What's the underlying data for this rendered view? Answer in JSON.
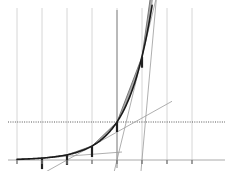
{
  "figure": {
    "title": "",
    "background_color": "#ffffff",
    "width": 229,
    "height": 171
  },
  "chart_data": {
    "type": "line",
    "title": "",
    "subtitle": "",
    "xlabel": "",
    "ylabel": "",
    "grid": true,
    "legend": null,
    "legend_position": "none",
    "xlim": [
      -4,
      4
    ],
    "ylim": [
      -0.6,
      7.0
    ],
    "x_ticks": [
      -4,
      -3,
      -2,
      -1,
      0,
      1,
      2,
      3
    ],
    "x_tick_labels": [
      "",
      "",
      "",
      "",
      "",
      "",
      "",
      ""
    ],
    "y_ticks": [
      1
    ],
    "y_tick_labels": [
      ""
    ],
    "axes": {
      "x_axis_y_value": 0,
      "y_axis_x_value": 0,
      "x_axis_color": "#aaaaaa",
      "y_axis_color": "#888888"
    },
    "reference_lines": [
      {
        "name": "unit-ordinate-line",
        "orientation": "horizontal",
        "value": 1,
        "style": "dotted",
        "color": "#444444"
      }
    ],
    "series": [
      {
        "name": "exponential-curve",
        "type": "line",
        "color": "#1a1a1a",
        "width": 1.6,
        "x": [
          -4.0,
          -3.6,
          -3.2,
          -2.8,
          -2.4,
          -2.0,
          -1.6,
          -1.2,
          -0.8,
          -0.4,
          0.0,
          0.4,
          0.8,
          1.2,
          1.6,
          2.0,
          2.4,
          2.8,
          3.0,
          3.2
        ],
        "y": [
          0.018,
          0.027,
          0.041,
          0.061,
          0.091,
          0.135,
          0.202,
          0.301,
          0.449,
          0.67,
          1.0,
          1.492,
          2.226,
          3.32,
          4.953,
          7.389,
          11.02,
          16.44,
          20.09,
          24.53
        ]
      },
      {
        "name": "secant-chords",
        "type": "segments",
        "color": "#6f6f6f",
        "width": 0.9,
        "chords": [
          {
            "x0": -4,
            "y0": 0.018,
            "x1": -3,
            "y1": 0.05
          },
          {
            "x0": -3,
            "y0": 0.05,
            "x1": -2,
            "y1": 0.135
          },
          {
            "x0": -2,
            "y0": 0.135,
            "x1": -1,
            "y1": 0.368
          },
          {
            "x0": -1,
            "y0": 0.368,
            "x1": 0,
            "y1": 1.0
          },
          {
            "x0": 0,
            "y0": 1.0,
            "x1": 1,
            "y1": 2.718
          },
          {
            "x0": 1,
            "y0": 2.718,
            "x1": 2,
            "y1": 7.389
          },
          {
            "x0": 2,
            "y0": 7.389,
            "x1": 3,
            "y1": 20.09
          }
        ]
      },
      {
        "name": "trapezoid-shaded-areas",
        "type": "area-between",
        "fill_color": "#8e8e8e",
        "opacity": 0.75,
        "intervals": [
          [
            -4,
            -3
          ],
          [
            -3,
            -2
          ],
          [
            -2,
            -1
          ],
          [
            -1,
            0
          ],
          [
            0,
            1
          ],
          [
            1,
            2
          ],
          [
            2,
            3
          ]
        ]
      },
      {
        "name": "ordinate-bars",
        "type": "vertical-bars",
        "color": "#222222",
        "width": 2.2,
        "points": [
          {
            "x": -4,
            "y_top": 0.018
          },
          {
            "x": -3,
            "y_top": 0.05
          },
          {
            "x": -2,
            "y_top": 0.135
          },
          {
            "x": -1,
            "y_top": 0.368
          },
          {
            "x": 0,
            "y_top": 1.0
          },
          {
            "x": 1,
            "y_top": 2.718
          },
          {
            "x": 2,
            "y_top": 7.389
          }
        ]
      },
      {
        "name": "tangent-lines",
        "type": "segments",
        "color": "#9a9a9a",
        "width": 0.8,
        "tangents": [
          {
            "at_x": -3,
            "slope": 0.05,
            "value": 0.05
          },
          {
            "at_x": -1,
            "slope": 0.368,
            "value": 0.368
          },
          {
            "at_x": 1,
            "slope": 2.718,
            "value": 2.718
          },
          {
            "at_x": 2,
            "slope": 7.389,
            "value": 7.389
          }
        ]
      }
    ],
    "gridlines": {
      "vertical": [
        -4,
        -3,
        -2,
        -1,
        0,
        1,
        2,
        3
      ],
      "vertical_color": "#cccccc",
      "horizontal": []
    }
  }
}
